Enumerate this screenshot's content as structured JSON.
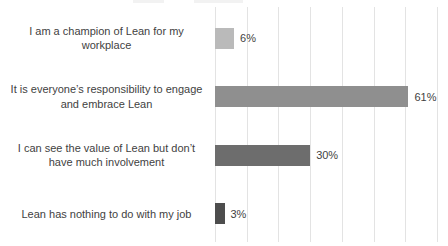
{
  "chart_data": {
    "type": "bar",
    "orientation": "horizontal",
    "title": "",
    "xlabel": "",
    "ylabel": "",
    "xlim": [
      0,
      70
    ],
    "gridline_interval": 10,
    "grid": true,
    "legend": false,
    "categories": [
      "I am a champion of Lean for my workplace",
      "It is everyone’s responsibility to engage and embrace Lean",
      "I can see the value of Lean but don’t have much involvement",
      "Lean has nothing to do with my job"
    ],
    "values": [
      6,
      61,
      30,
      3
    ],
    "data_labels": [
      "6%",
      "61%",
      "30%",
      "3%"
    ],
    "bar_colors": [
      "#bababa",
      "#8f8f8f",
      "#6d6d6d",
      "#4d4d4d"
    ],
    "gridline_color": "#e3e3e3",
    "text_color": "#3f3f3f",
    "background_color": "#ffffff"
  }
}
